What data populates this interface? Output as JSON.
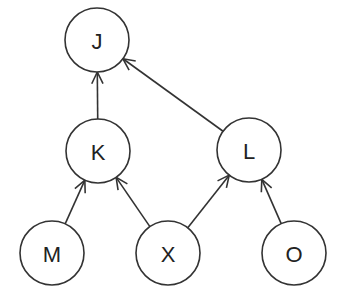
{
  "diagram": {
    "type": "directed-graph",
    "nodes": [
      {
        "id": "J",
        "label": "J",
        "x": 97,
        "y": 40
      },
      {
        "id": "K",
        "label": "K",
        "x": 98,
        "y": 151
      },
      {
        "id": "L",
        "label": "L",
        "x": 249,
        "y": 150
      },
      {
        "id": "M",
        "label": "M",
        "x": 52,
        "y": 253
      },
      {
        "id": "X",
        "label": "X",
        "x": 168,
        "y": 253
      },
      {
        "id": "O",
        "label": "O",
        "x": 294,
        "y": 253
      }
    ],
    "edges": [
      {
        "from": "K",
        "to": "J"
      },
      {
        "from": "L",
        "to": "J"
      },
      {
        "from": "M",
        "to": "K"
      },
      {
        "from": "X",
        "to": "K"
      },
      {
        "from": "X",
        "to": "L"
      },
      {
        "from": "O",
        "to": "L"
      }
    ],
    "node_radius": 32,
    "stroke_color": "#333333"
  }
}
